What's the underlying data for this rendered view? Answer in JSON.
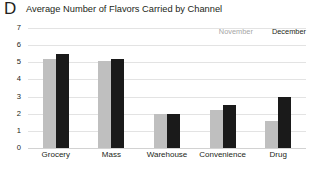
{
  "panel": {
    "letter": "D"
  },
  "chart_data": {
    "type": "bar",
    "title": "Average Number of Flavors Carried by Channel",
    "xlabel": "",
    "ylabel": "",
    "ylim": [
      0,
      7
    ],
    "yticks": [
      0,
      1,
      2,
      3,
      4,
      5,
      6,
      7
    ],
    "ytick_labels": [
      "0",
      "1",
      "2",
      "3",
      "4",
      "5",
      "6",
      "7"
    ],
    "grid": true,
    "legend_position": "top-right",
    "categories": [
      "Grocery",
      "Mass",
      "Warehouse",
      "Convenience",
      "Drug"
    ],
    "series": [
      {
        "name": "November",
        "color": "#bfbfbf",
        "values": [
          5.2,
          5.1,
          2.0,
          2.2,
          1.6
        ]
      },
      {
        "name": "December",
        "color": "#1a1a1a",
        "values": [
          5.5,
          5.2,
          2.0,
          2.5,
          3.0
        ]
      }
    ]
  }
}
